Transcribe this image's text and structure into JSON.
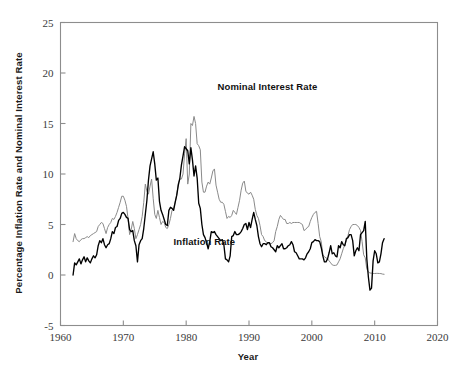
{
  "chart_data": {
    "type": "line",
    "title": "",
    "xlabel": "Year",
    "ylabel": "Percentage Inflation Rate and Nominal Interest Rate",
    "xlim": [
      1960,
      2020
    ],
    "ylim": [
      -5,
      25
    ],
    "xticks": [
      1960,
      1970,
      1980,
      1990,
      2000,
      2010,
      2020
    ],
    "xtick_labels": [
      "1960",
      "1970",
      "1980",
      "1990",
      "2000",
      "2010",
      "2020"
    ],
    "yticks": [
      -5,
      0,
      5,
      10,
      15,
      20,
      25
    ],
    "ytick_labels": [
      "-5",
      "0",
      "5",
      "10",
      "15",
      "20",
      "25"
    ],
    "grid": false,
    "legend_position": "inline-annotations",
    "series": [
      {
        "name": "Nominal Interest Rate",
        "color": "#8a8a8a",
        "linewidth": 1.0,
        "label_x": 1985.0,
        "label_y": 18.3,
        "x": [
          1962.0,
          1962.25,
          1962.5,
          1962.75,
          1963.0,
          1963.25,
          1963.5,
          1963.75,
          1964.0,
          1964.25,
          1964.5,
          1964.75,
          1965.0,
          1965.25,
          1965.5,
          1965.75,
          1966.0,
          1966.25,
          1966.5,
          1966.75,
          1967.0,
          1967.25,
          1967.5,
          1967.75,
          1968.0,
          1968.25,
          1968.5,
          1968.75,
          1969.0,
          1969.25,
          1969.5,
          1969.75,
          1970.0,
          1970.25,
          1970.5,
          1970.75,
          1971.0,
          1971.25,
          1971.5,
          1971.75,
          1972.0,
          1972.25,
          1972.5,
          1972.75,
          1973.0,
          1973.25,
          1973.5,
          1973.75,
          1974.0,
          1974.25,
          1974.5,
          1974.75,
          1975.0,
          1975.25,
          1975.5,
          1975.75,
          1976.0,
          1976.25,
          1976.5,
          1976.75,
          1977.0,
          1977.25,
          1977.5,
          1977.75,
          1978.0,
          1978.25,
          1978.5,
          1978.75,
          1979.0,
          1979.25,
          1979.5,
          1979.75,
          1980.0,
          1980.25,
          1980.5,
          1980.75,
          1981.0,
          1981.25,
          1981.5,
          1981.75,
          1982.0,
          1982.25,
          1982.5,
          1982.75,
          1983.0,
          1983.25,
          1983.5,
          1983.75,
          1984.0,
          1984.25,
          1984.5,
          1984.75,
          1985.0,
          1985.25,
          1985.5,
          1985.75,
          1986.0,
          1986.25,
          1986.5,
          1986.75,
          1987.0,
          1987.25,
          1987.5,
          1987.75,
          1988.0,
          1988.25,
          1988.5,
          1988.75,
          1989.0,
          1989.25,
          1989.5,
          1989.75,
          1990.0,
          1990.25,
          1990.5,
          1990.75,
          1991.0,
          1991.25,
          1991.5,
          1991.75,
          1992.0,
          1992.25,
          1992.5,
          1992.75,
          1993.0,
          1993.25,
          1993.5,
          1993.75,
          1994.0,
          1994.25,
          1994.5,
          1994.75,
          1995.0,
          1995.25,
          1995.5,
          1995.75,
          1996.0,
          1996.25,
          1996.5,
          1996.75,
          1997.0,
          1997.25,
          1997.5,
          1997.75,
          1998.0,
          1998.25,
          1998.5,
          1998.75,
          1999.0,
          1999.25,
          1999.5,
          1999.75,
          2000.0,
          2000.25,
          2000.5,
          2000.75,
          2001.0,
          2001.25,
          2001.5,
          2001.75,
          2002.0,
          2002.25,
          2002.5,
          2002.75,
          2003.0,
          2003.25,
          2003.5,
          2003.75,
          2004.0,
          2004.25,
          2004.5,
          2004.75,
          2005.0,
          2005.25,
          2005.5,
          2005.75,
          2006.0,
          2006.25,
          2006.5,
          2006.75,
          2007.0,
          2007.25,
          2007.5,
          2007.75,
          2008.0,
          2008.25,
          2008.5,
          2008.75,
          2009.0,
          2009.25,
          2009.5,
          2009.75,
          2010.0,
          2010.25,
          2010.5,
          2010.75,
          2011.0,
          2011.25,
          2011.5
        ],
        "values": [
          3.3,
          4.1,
          3.6,
          3.4,
          3.3,
          3.5,
          3.6,
          3.6,
          3.7,
          3.8,
          3.7,
          3.9,
          4.0,
          4.1,
          4.2,
          4.3,
          4.8,
          5.0,
          5.2,
          5.1,
          4.6,
          4.1,
          4.7,
          5.0,
          5.2,
          5.6,
          5.5,
          5.8,
          6.2,
          6.7,
          7.2,
          7.8,
          7.8,
          7.4,
          6.8,
          5.6,
          4.0,
          4.5,
          5.3,
          4.6,
          3.6,
          4.0,
          4.5,
          5.0,
          5.8,
          7.2,
          9.0,
          8.3,
          8.0,
          8.8,
          9.5,
          7.6,
          6.0,
          5.6,
          6.4,
          5.7,
          5.0,
          5.3,
          5.2,
          4.7,
          4.6,
          5.0,
          5.6,
          6.4,
          6.6,
          7.2,
          7.9,
          9.1,
          9.5,
          9.5,
          10.0,
          12.0,
          13.5,
          9.0,
          10.0,
          15.0,
          14.8,
          15.7,
          15.0,
          13.0,
          12.8,
          12.4,
          9.2,
          8.2,
          8.2,
          8.8,
          9.2,
          9.0,
          9.6,
          10.3,
          10.5,
          8.9,
          8.2,
          7.5,
          7.2,
          7.2,
          7.0,
          6.3,
          5.6,
          5.8,
          5.7,
          5.9,
          6.4,
          6.2,
          6.0,
          6.7,
          7.4,
          8.4,
          9.1,
          9.3,
          8.3,
          8.1,
          8.0,
          8.2,
          7.9,
          7.5,
          6.5,
          5.9,
          5.6,
          4.9,
          4.0,
          3.8,
          3.4,
          3.3,
          3.1,
          3.1,
          3.1,
          3.2,
          3.4,
          4.3,
          4.8,
          5.5,
          5.9,
          5.7,
          5.5,
          5.5,
          5.1,
          5.1,
          5.2,
          5.1,
          5.2,
          5.2,
          5.2,
          5.2,
          5.2,
          5.1,
          5.0,
          4.4,
          4.5,
          4.7,
          4.8,
          5.3,
          5.7,
          6.0,
          6.2,
          6.3,
          5.1,
          3.8,
          3.3,
          2.0,
          1.8,
          1.7,
          1.6,
          1.4,
          1.2,
          1.0,
          0.95,
          0.95,
          1.0,
          1.3,
          1.6,
          2.1,
          2.6,
          3.0,
          3.4,
          3.9,
          4.5,
          4.8,
          5.0,
          5.0,
          5.0,
          4.9,
          4.7,
          4.4,
          3.3,
          2.0,
          1.7,
          0.6,
          0.3,
          0.2,
          0.18,
          0.15,
          0.15,
          0.16,
          0.16,
          0.15,
          0.14,
          0.09,
          0.07
        ]
      },
      {
        "name": "Inflation Rate",
        "color": "#000000",
        "linewidth": 1.35,
        "label_x": 1978.0,
        "label_y": 3.0,
        "x": [
          1962.0,
          1962.25,
          1962.5,
          1962.75,
          1963.0,
          1963.25,
          1963.5,
          1963.75,
          1964.0,
          1964.25,
          1964.5,
          1964.75,
          1965.0,
          1965.25,
          1965.5,
          1965.75,
          1966.0,
          1966.25,
          1966.5,
          1966.75,
          1967.0,
          1967.25,
          1967.5,
          1967.75,
          1968.0,
          1968.25,
          1968.5,
          1968.75,
          1969.0,
          1969.25,
          1969.5,
          1969.75,
          1970.0,
          1970.25,
          1970.5,
          1970.75,
          1971.0,
          1971.25,
          1971.5,
          1971.75,
          1972.0,
          1972.25,
          1972.5,
          1972.75,
          1973.0,
          1973.25,
          1973.5,
          1973.75,
          1974.0,
          1974.25,
          1974.5,
          1974.75,
          1975.0,
          1975.25,
          1975.5,
          1975.75,
          1976.0,
          1976.25,
          1976.5,
          1976.75,
          1977.0,
          1977.25,
          1977.5,
          1977.75,
          1978.0,
          1978.25,
          1978.5,
          1978.75,
          1979.0,
          1979.25,
          1979.5,
          1979.75,
          1980.0,
          1980.25,
          1980.5,
          1980.75,
          1981.0,
          1981.25,
          1981.5,
          1981.75,
          1982.0,
          1982.25,
          1982.5,
          1982.75,
          1983.0,
          1983.25,
          1983.5,
          1983.75,
          1984.0,
          1984.25,
          1984.5,
          1984.75,
          1985.0,
          1985.25,
          1985.5,
          1985.75,
          1986.0,
          1986.25,
          1986.5,
          1986.75,
          1987.0,
          1987.25,
          1987.5,
          1987.75,
          1988.0,
          1988.25,
          1988.5,
          1988.75,
          1989.0,
          1989.25,
          1989.5,
          1989.75,
          1990.0,
          1990.25,
          1990.5,
          1990.75,
          1991.0,
          1991.25,
          1991.5,
          1991.75,
          1992.0,
          1992.25,
          1992.5,
          1992.75,
          1993.0,
          1993.25,
          1993.5,
          1993.75,
          1994.0,
          1994.25,
          1994.5,
          1994.75,
          1995.0,
          1995.25,
          1995.5,
          1995.75,
          1996.0,
          1996.25,
          1996.5,
          1996.75,
          1997.0,
          1997.25,
          1997.5,
          1997.75,
          1998.0,
          1998.25,
          1998.5,
          1998.75,
          1999.0,
          1999.25,
          1999.5,
          1999.75,
          2000.0,
          2000.25,
          2000.5,
          2000.75,
          2001.0,
          2001.25,
          2001.5,
          2001.75,
          2002.0,
          2002.25,
          2002.5,
          2002.75,
          2003.0,
          2003.25,
          2003.5,
          2003.75,
          2004.0,
          2004.25,
          2004.5,
          2004.75,
          2005.0,
          2005.25,
          2005.5,
          2005.75,
          2006.0,
          2006.25,
          2006.5,
          2006.75,
          2007.0,
          2007.25,
          2007.5,
          2007.75,
          2008.0,
          2008.25,
          2008.5,
          2008.75,
          2009.0,
          2009.25,
          2009.5,
          2009.75,
          2010.0,
          2010.25,
          2010.5,
          2010.75,
          2011.0,
          2011.25,
          2011.5
        ],
        "values": [
          0.0,
          1.2,
          1.0,
          1.3,
          1.6,
          1.1,
          1.5,
          1.8,
          1.3,
          1.7,
          1.4,
          1.2,
          1.6,
          1.9,
          1.7,
          2.0,
          2.9,
          3.4,
          3.2,
          3.6,
          3.0,
          2.7,
          3.0,
          3.1,
          3.6,
          4.3,
          4.1,
          4.7,
          4.8,
          5.4,
          5.6,
          6.1,
          6.2,
          6.0,
          5.7,
          5.6,
          4.5,
          4.3,
          4.4,
          3.4,
          2.9,
          1.3,
          3.0,
          3.4,
          3.6,
          4.6,
          6.0,
          7.4,
          9.4,
          10.8,
          11.5,
          12.2,
          11.0,
          9.4,
          9.6,
          7.3,
          6.4,
          6.0,
          5.5,
          5.0,
          4.9,
          6.4,
          6.7,
          6.6,
          6.4,
          7.2,
          7.9,
          8.9,
          9.6,
          10.9,
          11.8,
          12.7,
          12.5,
          12.3,
          11.0,
          12.6,
          11.4,
          9.8,
          10.8,
          9.6,
          7.1,
          6.6,
          5.0,
          4.0,
          3.7,
          3.2,
          2.6,
          3.3,
          4.3,
          4.2,
          4.3,
          4.0,
          3.8,
          3.6,
          3.4,
          3.5,
          3.0,
          1.6,
          1.5,
          1.3,
          1.9,
          3.8,
          3.9,
          4.3,
          4.0,
          4.0,
          4.1,
          4.3,
          4.6,
          5.0,
          5.1,
          4.5,
          5.2,
          4.7,
          5.5,
          6.2,
          5.5,
          4.9,
          3.8,
          3.1,
          2.8,
          3.1,
          3.1,
          3.0,
          3.2,
          3.2,
          2.8,
          2.7,
          2.5,
          2.3,
          2.9,
          2.7,
          2.9,
          3.1,
          2.6,
          2.6,
          2.7,
          2.9,
          3.0,
          3.3,
          3.0,
          2.3,
          2.2,
          1.9,
          1.6,
          1.6,
          1.6,
          1.5,
          1.7,
          2.1,
          2.3,
          2.6,
          3.2,
          3.3,
          3.5,
          3.4,
          3.4,
          3.3,
          2.7,
          1.9,
          1.3,
          1.3,
          1.6,
          2.2,
          2.9,
          2.1,
          2.2,
          1.9,
          1.8,
          2.9,
          2.7,
          3.3,
          3.0,
          2.9,
          3.6,
          3.7,
          4.0,
          4.0,
          3.4,
          1.9,
          2.4,
          2.7,
          2.4,
          4.0,
          4.2,
          4.4,
          5.3,
          1.6,
          -0.2,
          -1.5,
          -1.3,
          1.4,
          2.4,
          2.1,
          1.2,
          1.3,
          2.1,
          3.2,
          3.6
        ]
      }
    ]
  },
  "annotations": {
    "nominal_label": "Nominal Interest Rate",
    "inflation_label": "Inflation Rate"
  },
  "colors": {
    "nominal": "#8a8a8a",
    "inflation": "#000000",
    "frame": "#8d8d8d",
    "text": "#1a1a1a",
    "background": "#ffffff"
  }
}
